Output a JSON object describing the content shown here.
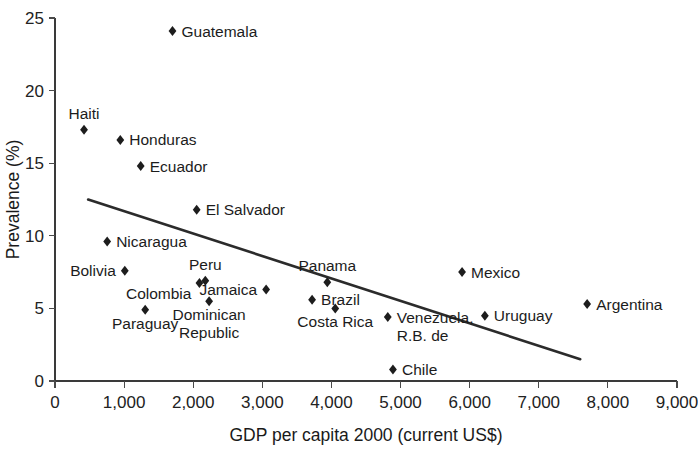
{
  "chart_data": {
    "type": "scatter",
    "title": "",
    "xlabel": "GDP per capita 2000 (current US$)",
    "ylabel": "Prevalence (%)",
    "xlim": [
      0,
      9000
    ],
    "ylim": [
      0,
      25
    ],
    "xticks": [
      0,
      1000,
      2000,
      3000,
      4000,
      5000,
      6000,
      7000,
      8000,
      9000
    ],
    "xtick_labels": [
      "0",
      "1,000",
      "2,000",
      "3,000",
      "4,000",
      "5,000",
      "6,000",
      "7,000",
      "8,000",
      "9,000"
    ],
    "yticks": [
      0,
      5,
      10,
      15,
      20,
      25
    ],
    "ytick_labels": [
      "0",
      "5",
      "10",
      "15",
      "20",
      "25"
    ],
    "grid": false,
    "legend": "none",
    "marker_shape": "diamond",
    "marker_color": "#1d1d1d",
    "points": [
      {
        "label": "Guatemala",
        "x": 1700,
        "y": 24.1,
        "label_pos": "right"
      },
      {
        "label": "Haiti",
        "x": 420,
        "y": 17.3,
        "label_pos": "above"
      },
      {
        "label": "Honduras",
        "x": 945,
        "y": 16.6,
        "label_pos": "right"
      },
      {
        "label": "Ecuador",
        "x": 1240,
        "y": 14.8,
        "label_pos": "right"
      },
      {
        "label": "El Salvador",
        "x": 2050,
        "y": 11.8,
        "label_pos": "right"
      },
      {
        "label": "Nicaragua",
        "x": 755,
        "y": 9.6,
        "label_pos": "right"
      },
      {
        "label": "Bolivia",
        "x": 1010,
        "y": 7.6,
        "label_pos": "left"
      },
      {
        "label": "Peru",
        "x": 2175,
        "y": 6.9,
        "label_pos": "above"
      },
      {
        "label": "Colombia",
        "x": 2090,
        "y": 6.75,
        "label_pos": "below-left"
      },
      {
        "label": "Jamaica",
        "x": 3055,
        "y": 6.3,
        "label_pos": "left"
      },
      {
        "label": "Panama",
        "x": 3940,
        "y": 6.8,
        "label_pos": "above"
      },
      {
        "label": "Mexico",
        "x": 5890,
        "y": 7.5,
        "label_pos": "right"
      },
      {
        "label": "Brazil",
        "x": 3720,
        "y": 5.6,
        "label_pos": "right"
      },
      {
        "label": "Costa Rica",
        "x": 4055,
        "y": 5.0,
        "label_pos": "below"
      },
      {
        "label": "Dominican Republic",
        "x": 2230,
        "y": 5.5,
        "label_pos": "below"
      },
      {
        "label": "Paraguay",
        "x": 1305,
        "y": 4.9,
        "label_pos": "below"
      },
      {
        "label": "Venezuela, R.B. de",
        "x": 4815,
        "y": 4.4,
        "label_pos": "right"
      },
      {
        "label": "Uruguay",
        "x": 6220,
        "y": 4.5,
        "label_pos": "right"
      },
      {
        "label": "Argentina",
        "x": 7700,
        "y": 5.3,
        "label_pos": "right"
      },
      {
        "label": "Chile",
        "x": 4890,
        "y": 0.8,
        "label_pos": "right"
      }
    ],
    "trendline": {
      "x_start": 480,
      "y_start": 12.5,
      "x_end": 7600,
      "y_end": 1.5,
      "color": "#2b2b2b"
    }
  }
}
